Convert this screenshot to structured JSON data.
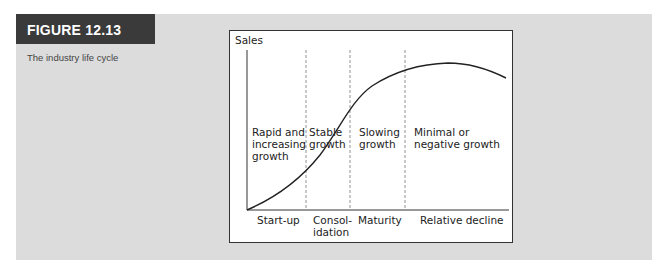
{
  "figure": {
    "label": "FIGURE 12.13",
    "caption": "The industry life cycle",
    "header_color": "#3a3a3a",
    "panel_color": "#dcdcdc"
  },
  "diagram": {
    "y_axis_label": "Sales",
    "stages": [
      {
        "name": "Start-up",
        "name_lines": [
          "Start-up"
        ],
        "description_lines": [
          "Rapid and",
          "increasing",
          "growth"
        ]
      },
      {
        "name": "Consolidation",
        "name_lines": [
          "Consol-",
          "idation"
        ],
        "description_lines": [
          "Stable",
          "growth"
        ]
      },
      {
        "name": "Maturity",
        "name_lines": [
          "Maturity"
        ],
        "description_lines": [
          "Slowing",
          "growth"
        ]
      },
      {
        "name": "Relative decline",
        "name_lines": [
          "Relative decline"
        ],
        "description_lines": [
          "Minimal or",
          "negative growth"
        ]
      }
    ],
    "curve": "S-shaped sales curve rising slowly, accelerating, flattening at maturity, then declining"
  }
}
